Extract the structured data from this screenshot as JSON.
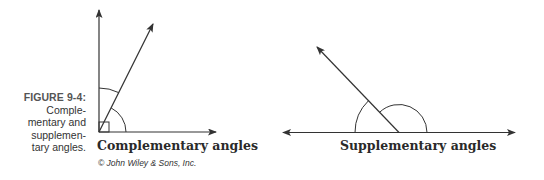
{
  "figure": {
    "label": "FIGURE 9-4:",
    "caption": "Comple-\nmentary and\nsupplemen-\ntary angles.",
    "credit": "© John Wiley & Sons, Inc."
  },
  "diagrams": [
    {
      "id": "complementary",
      "title": "Complementary angles",
      "vertex": [
        99,
        132
      ],
      "rays": [
        "vertical (90°)",
        "diagonal (~60°)",
        "horizontal (0°)"
      ],
      "marks": [
        "right-angle square",
        "outer arc between vertical and diagonal",
        "inner arc between diagonal and horizontal"
      ]
    },
    {
      "id": "supplementary",
      "title": "Supplementary angles",
      "vertex": [
        399,
        132
      ],
      "rays": [
        "left horizontal (180°)",
        "diagonal (~130°)",
        "right horizontal (0°)"
      ],
      "marks": [
        "arc between left horizontal and diagonal",
        "arc between diagonal and right horizontal"
      ]
    }
  ],
  "colors": {
    "line": "#333333",
    "text": "#2a2a2a",
    "background": "#ffffff"
  }
}
